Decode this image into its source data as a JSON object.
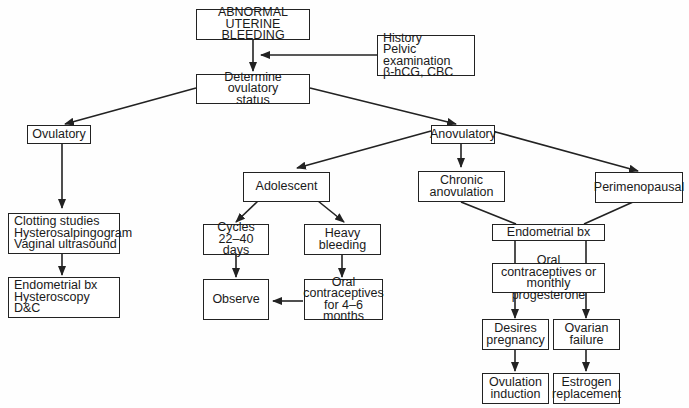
{
  "diagram": {
    "nodes": {
      "aub": "ABNORMAL UTERINE\nBLEEDING",
      "workup": "History\nPelvic examination\nβ-hCG, CBC",
      "determine": "Determine ovulatory\nstatus",
      "ovulatory": "Ovulatory",
      "anovulatory": "Anovulatory",
      "clotting": "Clotting studies\nHysterosalpingogram\nVaginal ultrasound",
      "endo_ovul": "Endometrial bx\nHysteroscopy\nD&C",
      "adolescent": "Adolescent",
      "chronic": "Chronic\nanovulation",
      "perimeno": "Perimenopausal",
      "cycles": "Cycles\n22–40 days",
      "heavy": "Heavy\nbleeding",
      "observe": "Observe",
      "ocp46": "Oral\ncontraceptives\nfor 4–6 months",
      "endo_bx": "Endometrial bx",
      "ocp_prog": "Oral contraceptives or\nmonthly progesterone",
      "desires": "Desires\npregnancy",
      "ovarian": "Ovarian\nfailure",
      "ovulation": "Ovulation\ninduction",
      "estrogen": "Estrogen\nreplacement"
    },
    "edges": [
      [
        "aub",
        "determine"
      ],
      [
        "workup",
        "aub-determine-line"
      ],
      [
        "determine",
        "ovulatory"
      ],
      [
        "determine",
        "anovulatory"
      ],
      [
        "ovulatory",
        "clotting"
      ],
      [
        "clotting",
        "endo_ovul"
      ],
      [
        "anovulatory",
        "adolescent"
      ],
      [
        "anovulatory",
        "chronic"
      ],
      [
        "anovulatory",
        "perimeno"
      ],
      [
        "adolescent",
        "cycles"
      ],
      [
        "adolescent",
        "heavy"
      ],
      [
        "cycles",
        "observe"
      ],
      [
        "heavy",
        "ocp46"
      ],
      [
        "ocp46",
        "observe"
      ],
      [
        "chronic",
        "endo_bx"
      ],
      [
        "perimeno",
        "endo_bx"
      ],
      [
        "endo_bx",
        "ocp_prog"
      ],
      [
        "ocp_prog",
        "desires"
      ],
      [
        "ocp_prog",
        "ovarian"
      ],
      [
        "desires",
        "ovulation"
      ],
      [
        "ovarian",
        "estrogen"
      ]
    ],
    "colors": {
      "line": "#222222",
      "background": "#ffffff"
    }
  }
}
